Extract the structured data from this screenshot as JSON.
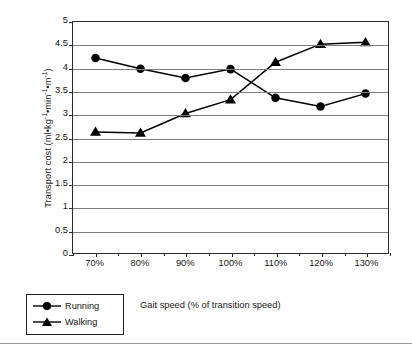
{
  "chart_data": {
    "type": "line",
    "title": "",
    "xlabel": "Gait speed (% of transition speed)",
    "ylabel": "Transport cost (ml•kg⁻¹•min⁻¹•m⁻¹)",
    "ylabel_parts": {
      "base": "Transport cost (ml•kg",
      "sup1": "-1",
      "mid1": "•min",
      "sup2": "-1",
      "mid2": "•m",
      "sup3": "-1",
      "tail": ")"
    },
    "categories": [
      "70%",
      "80%",
      "90%",
      "100%",
      "110%",
      "120%",
      "130%"
    ],
    "x_numeric": [
      70,
      80,
      90,
      100,
      110,
      120,
      130
    ],
    "xlim": [
      65,
      135
    ],
    "ylim": [
      0,
      5
    ],
    "yticks": [
      "0",
      "0.5",
      "1",
      "1.5",
      "2",
      "2.5",
      "3",
      "3.5",
      "4",
      "4.5",
      "5"
    ],
    "ytick_values": [
      0,
      0.5,
      1,
      1.5,
      2,
      2.5,
      3,
      3.5,
      4,
      4.5,
      5
    ],
    "grid": "horizontal",
    "legend_position": "below-left-outside",
    "series": [
      {
        "name": "Running",
        "marker": "circle",
        "color": "#000000",
        "values": [
          4.22,
          3.99,
          3.79,
          3.98,
          3.36,
          3.17,
          3.45
        ]
      },
      {
        "name": "Walking",
        "marker": "triangle",
        "color": "#000000",
        "values": [
          2.62,
          2.6,
          3.02,
          3.32,
          4.13,
          4.52,
          4.56
        ]
      }
    ]
  },
  "legend": {
    "items": [
      {
        "label": "Running",
        "marker": "circle-marker"
      },
      {
        "label": "Walking",
        "marker": "triangle-marker"
      }
    ]
  },
  "axes": {
    "x_title": "Gait speed (% of transition speed)",
    "y_title": "Transport cost (ml•kg⁻¹•min⁻¹•m⁻¹)"
  },
  "colors": {
    "line": "#000000",
    "grid": "#7d7d7d",
    "frame": "#2b2b2b",
    "text": "#141414",
    "background": "#ffffff"
  }
}
